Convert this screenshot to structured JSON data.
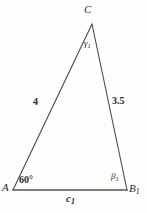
{
  "figure": {
    "type": "triangle-diagram",
    "background_color": "#fdfdfc",
    "stroke_color": "#4a4a4a",
    "base_stroke_color": "#555555",
    "text_color": "#2b2b2b",
    "vertices": {
      "C": {
        "label": "C",
        "x": 92,
        "y": 24
      },
      "A": {
        "label": "A",
        "x": 13,
        "y": 190
      },
      "B1": {
        "label_main": "B",
        "label_sub": "1",
        "x": 127,
        "y": 190
      }
    },
    "sides": {
      "left": {
        "label": "4",
        "from": "A",
        "to": "C"
      },
      "right": {
        "label": "3.5",
        "from": "C",
        "to": "B1"
      },
      "base": {
        "label_main": "c",
        "label_sub": "1",
        "from": "A",
        "to": "B1"
      }
    },
    "angles": {
      "at_A": {
        "label": "60°"
      },
      "at_B1": {
        "label_main": "β",
        "label_sub": "1"
      },
      "at_C": {
        "label_main": "γ",
        "label_sub": "1"
      }
    }
  }
}
